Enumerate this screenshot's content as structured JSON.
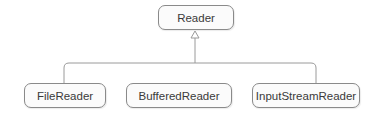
{
  "diagram": {
    "type": "class-hierarchy",
    "root": {
      "label": "Reader"
    },
    "children": [
      {
        "label": "FileReader"
      },
      {
        "label": "BufferedReader"
      },
      {
        "label": "InputStreamReader"
      }
    ],
    "relation": "inheritance (hollow triangle arrow pointing to parent)",
    "colors": {
      "border": "#8a8a8a",
      "fill": "#fbfbfb",
      "line": "#9a9a9a",
      "text": "#3a3a3a"
    }
  }
}
